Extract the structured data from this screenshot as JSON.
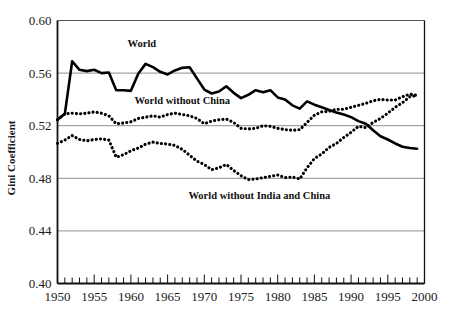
{
  "chart_data": {
    "type": "line",
    "title": "",
    "xlabel": "",
    "ylabel": "Gini Coefficient",
    "xlim": [
      1950,
      2000
    ],
    "ylim": [
      0.4,
      0.6
    ],
    "grid": true,
    "grid_axis": "y",
    "legend_position": "inline-annotations",
    "y_ticks": [
      "0.40",
      "0.44",
      "0.48",
      "0.52",
      "0.56",
      "0.60"
    ],
    "y_tick_values": [
      0.4,
      0.44,
      0.48,
      0.52,
      0.56,
      0.6
    ],
    "x_ticks": [
      "1950",
      "1955",
      "1960",
      "1965",
      "1970",
      "1975",
      "1980",
      "1985",
      "1990",
      "1995",
      "2000"
    ],
    "x_tick_values": [
      1950,
      1955,
      1960,
      1965,
      1970,
      1975,
      1980,
      1985,
      1990,
      1995,
      2000
    ],
    "x_minor_tick_interval": 1,
    "x": [
      1950,
      1951,
      1952,
      1953,
      1954,
      1955,
      1956,
      1957,
      1958,
      1959,
      1960,
      1961,
      1962,
      1963,
      1964,
      1965,
      1966,
      1967,
      1968,
      1969,
      1970,
      1971,
      1972,
      1973,
      1974,
      1975,
      1976,
      1977,
      1978,
      1979,
      1980,
      1981,
      1982,
      1983,
      1984,
      1985,
      1986,
      1987,
      1988,
      1989,
      1990,
      1991,
      1992,
      1993,
      1994,
      1995,
      1996,
      1997,
      1998,
      1999
    ],
    "series": [
      {
        "name": "World",
        "style": "solid",
        "color": "#000000",
        "label_text": "World",
        "values": [
          0.5245,
          0.529,
          0.569,
          0.5625,
          0.5615,
          0.5625,
          0.56,
          0.5605,
          0.547,
          0.547,
          0.5465,
          0.5595,
          0.567,
          0.5645,
          0.561,
          0.559,
          0.562,
          0.564,
          0.5645,
          0.556,
          0.5475,
          0.5445,
          0.546,
          0.55,
          0.545,
          0.541,
          0.5435,
          0.547,
          0.5455,
          0.547,
          0.5415,
          0.54,
          0.5355,
          0.533,
          0.5385,
          0.536,
          0.534,
          0.532,
          0.53,
          0.5285,
          0.5265,
          0.5235,
          0.5215,
          0.5165,
          0.512,
          0.5095,
          0.5065,
          0.504,
          0.503,
          0.5025
        ]
      },
      {
        "name": "World without China",
        "style": "dotted",
        "color": "#000000",
        "label_text": "World without China",
        "values": [
          0.5245,
          0.529,
          0.5295,
          0.529,
          0.5295,
          0.5305,
          0.5295,
          0.5275,
          0.5215,
          0.522,
          0.523,
          0.5255,
          0.5265,
          0.5275,
          0.5265,
          0.5285,
          0.5295,
          0.5285,
          0.5275,
          0.5255,
          0.5215,
          0.5235,
          0.5245,
          0.525,
          0.5225,
          0.518,
          0.5175,
          0.518,
          0.52,
          0.5195,
          0.518,
          0.517,
          0.5165,
          0.517,
          0.5225,
          0.528,
          0.5305,
          0.531,
          0.5325,
          0.5325,
          0.534,
          0.5355,
          0.537,
          0.539,
          0.54,
          0.5395,
          0.5395,
          0.542,
          0.544,
          0.543
        ]
      },
      {
        "name": "World without India and China",
        "style": "dotted",
        "color": "#000000",
        "label_text": "World without India and China",
        "values": [
          0.5065,
          0.509,
          0.5125,
          0.5095,
          0.5085,
          0.5095,
          0.51,
          0.509,
          0.496,
          0.498,
          0.501,
          0.503,
          0.506,
          0.5075,
          0.5065,
          0.506,
          0.505,
          0.502,
          0.4975,
          0.493,
          0.4905,
          0.4865,
          0.488,
          0.4905,
          0.486,
          0.482,
          0.479,
          0.4795,
          0.4805,
          0.4815,
          0.4825,
          0.4805,
          0.481,
          0.4795,
          0.488,
          0.495,
          0.4985,
          0.5035,
          0.5065,
          0.511,
          0.515,
          0.5195,
          0.5185,
          0.5225,
          0.5255,
          0.5295,
          0.534,
          0.5375,
          0.542,
          0.543
        ]
      }
    ],
    "annotations": [
      {
        "text": "World",
        "x": 1961.5,
        "y": 0.5795
      },
      {
        "text": "World without China",
        "x": 1967.0,
        "y": 0.5365
      },
      {
        "text": "World without India and China",
        "x": 1977.5,
        "y": 0.4645
      }
    ]
  }
}
